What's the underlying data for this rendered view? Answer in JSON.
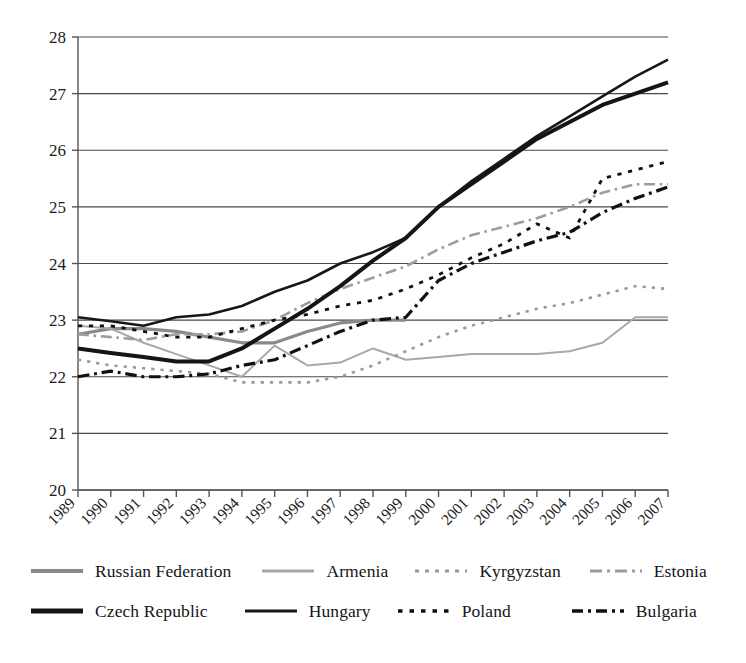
{
  "chart_data": {
    "type": "line",
    "title": "",
    "subtitle": "",
    "xlabel": "",
    "ylabel": "",
    "xlim": [
      1989,
      2007
    ],
    "ylim": [
      20,
      28
    ],
    "yticks": [
      20,
      21,
      22,
      23,
      24,
      25,
      26,
      27,
      28
    ],
    "grid": "horizontal",
    "legend_position": "bottom",
    "x": [
      1989,
      1990,
      1991,
      1992,
      1993,
      1994,
      1995,
      1996,
      1997,
      1998,
      1999,
      2000,
      2001,
      2002,
      2003,
      2004,
      2005,
      2006,
      2007
    ],
    "categories": [
      "1989",
      "1990",
      "1991",
      "1992",
      "1993",
      "1994",
      "1995",
      "1996",
      "1997",
      "1998",
      "1999",
      "2000",
      "2001",
      "2002",
      "2003",
      "2004",
      "2005",
      "2006",
      "2007"
    ],
    "series": [
      {
        "name": "Russian Federation",
        "style": "solid",
        "color": "#8a8a8a",
        "width": 3.2,
        "values": [
          22.75,
          22.85,
          22.85,
          22.8,
          22.7,
          22.6,
          22.6,
          22.8,
          22.95,
          23.0,
          23.0,
          null,
          null,
          null,
          null,
          null,
          null,
          null,
          null
        ]
      },
      {
        "name": "Armenia",
        "style": "solid",
        "color": "#a8a8a8",
        "width": 2.0,
        "values": [
          22.9,
          22.85,
          22.6,
          22.4,
          22.2,
          22.0,
          22.55,
          22.2,
          22.25,
          22.5,
          22.3,
          22.35,
          22.4,
          22.4,
          22.4,
          22.45,
          22.6,
          23.05,
          23.05
        ]
      },
      {
        "name": "Kyrgyzstan",
        "style": "dotted",
        "color": "#9a9a9a",
        "width": 2.6,
        "values": [
          22.3,
          22.2,
          22.15,
          22.1,
          22.05,
          21.9,
          21.9,
          21.9,
          22.0,
          22.2,
          22.45,
          22.7,
          22.9,
          23.05,
          23.2,
          23.3,
          23.45,
          23.6,
          23.55
        ]
      },
      {
        "name": "Estonia",
        "style": "dashed",
        "color": "#9d9d9d",
        "width": 2.6,
        "values": [
          22.75,
          22.7,
          22.65,
          22.75,
          22.75,
          22.8,
          23.0,
          23.3,
          23.55,
          23.75,
          23.95,
          24.25,
          24.5,
          24.65,
          24.8,
          25.0,
          25.25,
          25.4,
          25.4
        ]
      },
      {
        "name": "Czech Republic",
        "style": "solid",
        "color": "#151515",
        "width": 4.0,
        "values": [
          22.5,
          22.42,
          22.35,
          22.27,
          22.27,
          22.5,
          22.85,
          23.2,
          23.6,
          24.05,
          24.45,
          25.0,
          25.4,
          25.8,
          26.2,
          26.5,
          26.8,
          27.0,
          27.2
        ]
      },
      {
        "name": "Hungary",
        "style": "solid",
        "color": "#171717",
        "width": 2.6,
        "values": [
          23.05,
          22.98,
          22.9,
          23.05,
          23.1,
          23.25,
          23.5,
          23.7,
          24.0,
          24.2,
          24.45,
          25.0,
          25.45,
          25.85,
          26.25,
          26.6,
          26.95,
          27.3,
          27.6
        ]
      },
      {
        "name": "Poland",
        "style": "fine-dotted",
        "color": "#111111",
        "width": 2.8,
        "values": [
          22.9,
          22.9,
          22.8,
          22.7,
          22.7,
          22.85,
          23.0,
          23.1,
          23.25,
          23.35,
          23.55,
          23.8,
          24.1,
          24.35,
          24.7,
          24.45,
          25.5,
          25.65,
          25.8
        ]
      },
      {
        "name": "Bulgaria",
        "style": "long-dashed",
        "color": "#111111",
        "width": 3.2,
        "values": [
          22.0,
          22.1,
          22.0,
          22.0,
          22.05,
          22.2,
          22.3,
          22.55,
          22.8,
          23.0,
          23.05,
          23.7,
          24.0,
          24.2,
          24.4,
          24.55,
          24.9,
          25.15,
          25.35
        ]
      }
    ]
  },
  "legend": {
    "rows": [
      [
        {
          "label": "Russian Federation",
          "series": "Russian Federation"
        },
        {
          "label": "Armenia",
          "series": "Armenia"
        },
        {
          "label": "Kyrgyzstan",
          "series": "Kyrgyzstan"
        },
        {
          "label": "Estonia",
          "series": "Estonia"
        }
      ],
      [
        {
          "label": "Czech Republic",
          "series": "Czech Republic"
        },
        {
          "label": "Hungary",
          "series": "Hungary"
        },
        {
          "label": "Poland",
          "series": "Poland"
        },
        {
          "label": "Bulgaria",
          "series": "Bulgaria"
        }
      ]
    ]
  },
  "legend_labels": {
    "russian_federation": "Russian Federation",
    "armenia": "Armenia",
    "kyrgyzstan": "Kyrgyzstan",
    "estonia": "Estonia",
    "czech_republic": "Czech Republic",
    "hungary": "Hungary",
    "poland": "Poland",
    "bulgaria": "Bulgaria"
  },
  "colors": {
    "axis": "#555555",
    "grid": "#4a4a4a",
    "text": "#1a1a1a",
    "background": "#ffffff"
  }
}
